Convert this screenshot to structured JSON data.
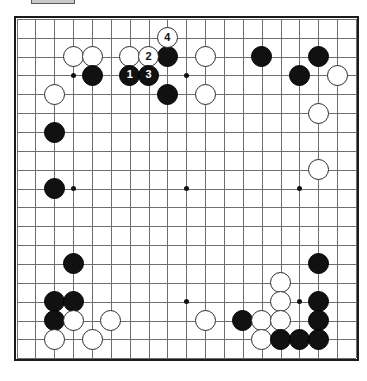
{
  "app": {
    "title": "Go Board Diagram",
    "toolbar_chip_label": ""
  },
  "board": {
    "size": 19,
    "origin_x": 16.6,
    "origin_y": 18.9,
    "spacing": 18.85,
    "line_color": "#6e6e6e",
    "border_color": "#1a1a1a",
    "background": "#ffffff",
    "black_color": "#111111",
    "white_color": "#ffffff",
    "star_points": [
      [
        3,
        3
      ],
      [
        9,
        3
      ],
      [
        15,
        3
      ],
      [
        3,
        9
      ],
      [
        9,
        9
      ],
      [
        15,
        9
      ],
      [
        3,
        15
      ],
      [
        9,
        15
      ],
      [
        15,
        15
      ]
    ]
  },
  "stones": [
    {
      "c": 3,
      "r": 2,
      "color": "white",
      "label": ""
    },
    {
      "c": 4,
      "r": 2,
      "color": "white",
      "label": ""
    },
    {
      "c": 6,
      "r": 2,
      "color": "white",
      "label": ""
    },
    {
      "c": 7,
      "r": 2,
      "color": "white",
      "label": "2"
    },
    {
      "c": 8,
      "r": 2,
      "color": "black",
      "label": ""
    },
    {
      "c": 8,
      "r": 1,
      "color": "white",
      "label": "4"
    },
    {
      "c": 10,
      "r": 2,
      "color": "white",
      "label": ""
    },
    {
      "c": 13,
      "r": 2,
      "color": "black",
      "label": ""
    },
    {
      "c": 16,
      "r": 2,
      "color": "black",
      "label": ""
    },
    {
      "c": 4,
      "r": 3,
      "color": "black",
      "label": ""
    },
    {
      "c": 6,
      "r": 3,
      "color": "black",
      "label": "1"
    },
    {
      "c": 7,
      "r": 3,
      "color": "black",
      "label": "3"
    },
    {
      "c": 15,
      "r": 3,
      "color": "black",
      "label": ""
    },
    {
      "c": 17,
      "r": 3,
      "color": "white",
      "label": ""
    },
    {
      "c": 8,
      "r": 4,
      "color": "black",
      "label": ""
    },
    {
      "c": 10,
      "r": 4,
      "color": "white",
      "label": ""
    },
    {
      "c": 2,
      "r": 4,
      "color": "white",
      "label": ""
    },
    {
      "c": 16,
      "r": 5,
      "color": "white",
      "label": ""
    },
    {
      "c": 2,
      "r": 6,
      "color": "black",
      "label": ""
    },
    {
      "c": 16,
      "r": 8,
      "color": "white",
      "label": ""
    },
    {
      "c": 2,
      "r": 9,
      "color": "black",
      "label": ""
    },
    {
      "c": 3,
      "r": 13,
      "color": "black",
      "label": ""
    },
    {
      "c": 16,
      "r": 13,
      "color": "black",
      "label": ""
    },
    {
      "c": 2,
      "r": 15,
      "color": "black",
      "label": ""
    },
    {
      "c": 3,
      "r": 15,
      "color": "black",
      "label": ""
    },
    {
      "c": 14,
      "r": 14,
      "color": "white",
      "label": ""
    },
    {
      "c": 14,
      "r": 15,
      "color": "white",
      "label": ""
    },
    {
      "c": 16,
      "r": 15,
      "color": "black",
      "label": ""
    },
    {
      "c": 2,
      "r": 16,
      "color": "black",
      "label": ""
    },
    {
      "c": 3,
      "r": 16,
      "color": "white",
      "label": ""
    },
    {
      "c": 5,
      "r": 16,
      "color": "white",
      "label": ""
    },
    {
      "c": 10,
      "r": 16,
      "color": "white",
      "label": ""
    },
    {
      "c": 12,
      "r": 16,
      "color": "black",
      "label": ""
    },
    {
      "c": 13,
      "r": 16,
      "color": "white",
      "label": ""
    },
    {
      "c": 14,
      "r": 16,
      "color": "white",
      "label": ""
    },
    {
      "c": 16,
      "r": 16,
      "color": "black",
      "label": ""
    },
    {
      "c": 2,
      "r": 17,
      "color": "white",
      "label": ""
    },
    {
      "c": 4,
      "r": 17,
      "color": "white",
      "label": ""
    },
    {
      "c": 13,
      "r": 17,
      "color": "white",
      "label": ""
    },
    {
      "c": 14,
      "r": 17,
      "color": "black",
      "label": ""
    },
    {
      "c": 15,
      "r": 17,
      "color": "black",
      "label": ""
    },
    {
      "c": 16,
      "r": 17,
      "color": "black",
      "label": ""
    }
  ],
  "move_sequence": [
    {
      "number": "1",
      "color": "black",
      "c": 6,
      "r": 3
    },
    {
      "number": "2",
      "color": "white",
      "c": 7,
      "r": 2
    },
    {
      "number": "3",
      "color": "black",
      "c": 7,
      "r": 3
    },
    {
      "number": "4",
      "color": "white",
      "c": 8,
      "r": 1
    }
  ]
}
